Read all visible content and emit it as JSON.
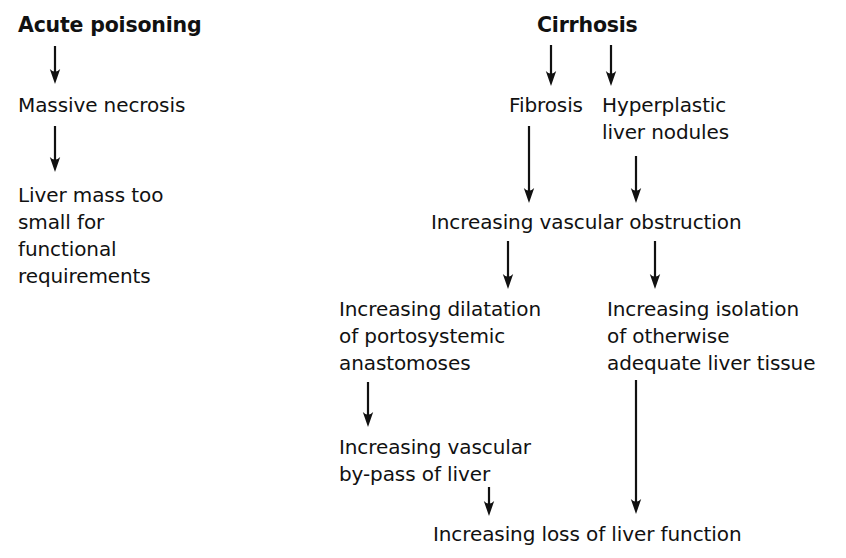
{
  "diagram": {
    "background_color": "#ffffff",
    "ink_color": "#111111",
    "width": 846,
    "height": 558,
    "nodes": [
      {
        "id": "acute-poisoning",
        "text": "Acute poisoning",
        "emphasis": "bold",
        "x": 18,
        "y": 12,
        "branch": "left"
      },
      {
        "id": "massive-necrosis",
        "text": "Massive necrosis",
        "emphasis": "normal",
        "x": 18,
        "y": 92,
        "branch": "left"
      },
      {
        "id": "liver-mass-too-small",
        "text": "Liver mass too\nsmall for\nfunctional\nrequirements",
        "emphasis": "normal",
        "x": 18,
        "y": 182,
        "branch": "left"
      },
      {
        "id": "cirrhosis",
        "text": "Cirrhosis",
        "emphasis": "bold",
        "x": 537,
        "y": 12,
        "branch": "right"
      },
      {
        "id": "fibrosis",
        "text": "Fibrosis",
        "emphasis": "normal",
        "x": 509,
        "y": 92,
        "branch": "right"
      },
      {
        "id": "hyperplastic-liver-nodules",
        "text": "Hyperplastic\nliver nodules",
        "emphasis": "normal",
        "x": 602,
        "y": 92,
        "branch": "right"
      },
      {
        "id": "increasing-vascular-obstruction",
        "text": "Increasing vascular obstruction",
        "emphasis": "normal",
        "x": 431,
        "y": 209,
        "branch": "right"
      },
      {
        "id": "increasing-dilatation",
        "text": "Increasing dilatation\nof portosystemic\nanastomoses",
        "emphasis": "normal",
        "x": 339,
        "y": 296,
        "branch": "right"
      },
      {
        "id": "increasing-isolation",
        "text": "Increasing isolation\nof otherwise\nadequate liver tissue",
        "emphasis": "normal",
        "x": 607,
        "y": 296,
        "branch": "right"
      },
      {
        "id": "increasing-vascular-by-pass",
        "text": "Increasing vascular\nby-pass of liver",
        "emphasis": "normal",
        "x": 339,
        "y": 434,
        "branch": "right"
      },
      {
        "id": "increasing-loss-of-liver-function",
        "text": "Increasing loss of liver function",
        "emphasis": "normal",
        "x": 433,
        "y": 521,
        "branch": "right"
      }
    ],
    "arrows": [
      {
        "id": "arrow-acute-to-necrosis",
        "from": "acute-poisoning",
        "to": "massive-necrosis",
        "x1": 55,
        "y1": 46,
        "x2": 55,
        "y2": 84
      },
      {
        "id": "arrow-necrosis-to-liver-mass",
        "from": "massive-necrosis",
        "to": "liver-mass-too-small",
        "x1": 55,
        "y1": 126,
        "x2": 55,
        "y2": 172
      },
      {
        "id": "arrow-cirrhosis-to-fibrosis",
        "from": "cirrhosis",
        "to": "fibrosis",
        "x1": 551,
        "y1": 45,
        "x2": 551,
        "y2": 86
      },
      {
        "id": "arrow-cirrhosis-to-nodules",
        "from": "cirrhosis",
        "to": "hyperplastic-liver-nodules",
        "x1": 611,
        "y1": 45,
        "x2": 611,
        "y2": 86
      },
      {
        "id": "arrow-fibrosis-to-obstruction",
        "from": "fibrosis",
        "to": "increasing-vascular-obstruction",
        "x1": 529,
        "y1": 126,
        "x2": 529,
        "y2": 203
      },
      {
        "id": "arrow-nodules-to-obstruction",
        "from": "hyperplastic-liver-nodules",
        "to": "increasing-vascular-obstruction",
        "x1": 636,
        "y1": 156,
        "x2": 636,
        "y2": 203
      },
      {
        "id": "arrow-obstruction-to-dilatation",
        "from": "increasing-vascular-obstruction",
        "to": "increasing-dilatation",
        "x1": 508,
        "y1": 241,
        "x2": 508,
        "y2": 289
      },
      {
        "id": "arrow-obstruction-to-isolation",
        "from": "increasing-vascular-obstruction",
        "to": "increasing-isolation",
        "x1": 655,
        "y1": 241,
        "x2": 655,
        "y2": 289
      },
      {
        "id": "arrow-dilatation-to-by-pass",
        "from": "increasing-dilatation",
        "to": "increasing-vascular-by-pass",
        "x1": 368,
        "y1": 382,
        "x2": 368,
        "y2": 427
      },
      {
        "id": "arrow-isolation-to-loss",
        "from": "increasing-isolation",
        "to": "increasing-loss-of-liver-function",
        "x1": 636,
        "y1": 380,
        "x2": 636,
        "y2": 514
      },
      {
        "id": "arrow-by-pass-to-loss",
        "from": "increasing-vascular-by-pass",
        "to": "increasing-loss-of-liver-function",
        "x1": 489,
        "y1": 487,
        "x2": 489,
        "y2": 516
      }
    ]
  }
}
